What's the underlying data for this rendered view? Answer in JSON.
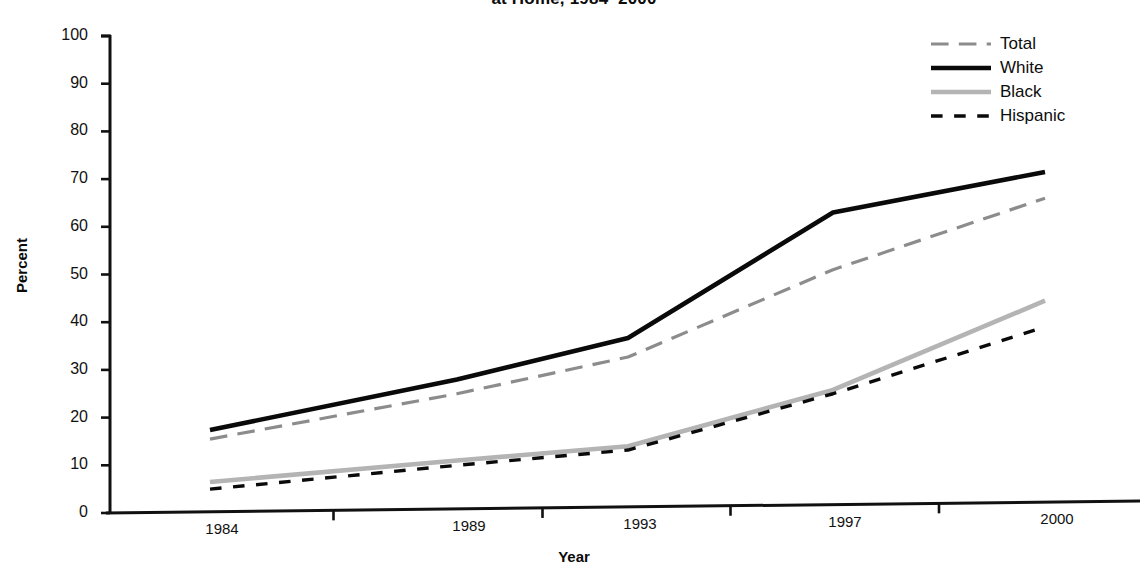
{
  "chart_data": {
    "type": "line",
    "title": "at Home, 1984–2000",
    "xlabel": "Year",
    "ylabel": "Percent",
    "categories": [
      "1984",
      "1989",
      "1993",
      "1997",
      "2000"
    ],
    "ylim": [
      0,
      100
    ],
    "yticks": [
      "0",
      "10",
      "20",
      "30",
      "40",
      "50",
      "60",
      "70",
      "80",
      "90",
      "100"
    ],
    "grid": false,
    "legend_position": "top-right",
    "series": [
      {
        "name": "Total",
        "values": [
          15.5,
          25.0,
          32.7,
          51.0,
          66.0
        ],
        "color": "#8c8c8c",
        "style": "dashed",
        "width": 3.2
      },
      {
        "name": "White",
        "values": [
          17.4,
          28.0,
          36.7,
          63.0,
          71.5
        ],
        "color": "#0a0a0a",
        "style": "solid",
        "width": 4.6
      },
      {
        "name": "Black",
        "values": [
          6.5,
          11.0,
          14.0,
          25.8,
          44.5
        ],
        "color": "#b4b4b4",
        "style": "solid",
        "width": 4.6
      },
      {
        "name": "Hispanic",
        "values": [
          5.0,
          10.0,
          13.2,
          25.0,
          39.0
        ],
        "color": "#0a0a0a",
        "style": "dotted",
        "width": 3.4
      }
    ]
  },
  "axis": {
    "y_title": "Percent",
    "x_title": "Year"
  },
  "legend": {
    "items": [
      {
        "label": "Total"
      },
      {
        "label": "White"
      },
      {
        "label": "Black"
      },
      {
        "label": "Hispanic"
      }
    ]
  }
}
